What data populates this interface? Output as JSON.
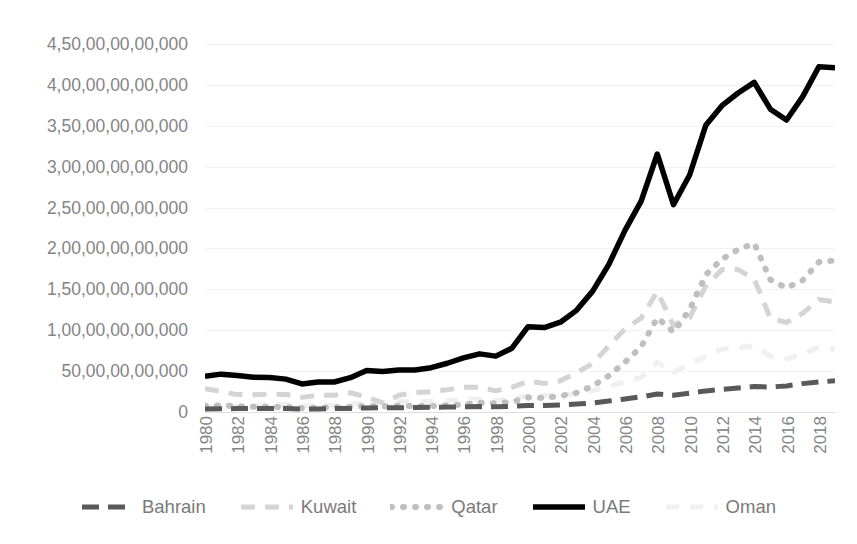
{
  "chart_data": {
    "type": "line",
    "title": "",
    "subtitle": "",
    "xlabel": "",
    "ylabel": "",
    "grid": true,
    "legend_position": "bottom",
    "xlim": [
      1980,
      2019
    ],
    "ylim": [
      0,
      450000000000
    ],
    "y_tick_labels": [
      "4,50,00,00,00,000",
      "4,00,00,00,00,000",
      "3,50,00,00,00,000",
      "3,00,00,00,00,000",
      "2,50,00,00,00,000",
      "2,00,00,00,00,000",
      "1,50,00,00,00,000",
      "1,00,00,00,00,000",
      "50,00,00,00,000",
      "0"
    ],
    "y_tick_values": [
      450000000000,
      400000000000,
      350000000000,
      300000000000,
      250000000000,
      200000000000,
      150000000000,
      100000000000,
      50000000000,
      0
    ],
    "x_tick_labels": [
      "1980",
      "1982",
      "1984",
      "1986",
      "1988",
      "1990",
      "1992",
      "1994",
      "1996",
      "1998",
      "2000",
      "2002",
      "2004",
      "2006",
      "2008",
      "2010",
      "2012",
      "2014",
      "2016",
      "2018"
    ],
    "x": [
      1980,
      1981,
      1982,
      1983,
      1984,
      1985,
      1986,
      1987,
      1988,
      1989,
      1990,
      1991,
      1992,
      1993,
      1994,
      1995,
      1996,
      1997,
      1998,
      1999,
      2000,
      2001,
      2002,
      2003,
      2004,
      2005,
      2006,
      2007,
      2008,
      2009,
      2010,
      2011,
      2012,
      2013,
      2014,
      2015,
      2016,
      2017,
      2018,
      2019
    ],
    "series": [
      {
        "name": "Bahrain",
        "color": "#595959",
        "style": "dashed",
        "width": 5.0,
        "dash": "17,9",
        "values": [
          3600000000,
          4000000000,
          4200000000,
          4300000000,
          4400000000,
          4200000000,
          3600000000,
          3800000000,
          4200000000,
          4400000000,
          5000000000,
          5100000000,
          5300000000,
          5400000000,
          5700000000,
          6000000000,
          6300000000,
          6600000000,
          6300000000,
          6900000000,
          8000000000,
          8000000000,
          8500000000,
          9700000000,
          11100000000,
          13500000000,
          15900000000,
          18500000000,
          22100000000,
          20600000000,
          22900000000,
          25800000000,
          27700000000,
          29400000000,
          31100000000,
          30600000000,
          31900000000,
          34700000000,
          36600000000,
          38200000000
        ]
      },
      {
        "name": "Kuwait",
        "color": "#d4d4d4",
        "style": "dashed",
        "width": 5.0,
        "dash": "14,10",
        "values": [
          28600000000,
          25100000000,
          21300000000,
          21200000000,
          21900000000,
          21500000000,
          17900000000,
          20300000000,
          20600000000,
          23500000000,
          18400000000,
          11200000000,
          20500000000,
          23600000000,
          24800000000,
          27200000000,
          30400000000,
          30400000000,
          25900000000,
          30100000000,
          37700000000,
          34900000000,
          38100000000,
          47900000000,
          59400000000,
          80800000000,
          101600000000,
          114700000000,
          147400000000,
          105900000000,
          115400000000,
          154000000000,
          174100000000,
          174200000000,
          162600000000,
          114700000000,
          109400000000,
          120700000000,
          137600000000,
          134600000000
        ]
      },
      {
        "name": "Qatar",
        "color": "#bfbfbf",
        "style": "dotted",
        "width": 6.0,
        "dash": "1,11",
        "values": [
          7700000000,
          8100000000,
          7000000000,
          6300000000,
          6400000000,
          6000000000,
          4700000000,
          5200000000,
          5700000000,
          6200000000,
          7400000000,
          6900000000,
          7700000000,
          7100000000,
          7300000000,
          8100000000,
          9100000000,
          11300000000,
          10700000000,
          12400000000,
          17800000000,
          17500000000,
          19500000000,
          23500000000,
          31700000000,
          44500000000,
          60900000000,
          79700000000,
          115300000000,
          97800000000,
          125100000000,
          167800000000,
          186800000000,
          198700000000,
          206200000000,
          161700000000,
          151700000000,
          161100000000,
          183300000000,
          185400000000
        ]
      },
      {
        "name": "UAE",
        "color": "#000000",
        "style": "solid",
        "width": 5.5,
        "dash": "",
        "values": [
          43600000000,
          46300000000,
          44700000000,
          42500000000,
          42100000000,
          40200000000,
          34300000000,
          36600000000,
          36700000000,
          42000000000,
          50700000000,
          49500000000,
          51300000000,
          51300000000,
          54200000000,
          59600000000,
          66100000000,
          71100000000,
          68300000000,
          78000000000,
          104300000000,
          103300000000,
          109800000000,
          124300000000,
          147800000000,
          180600000000,
          222100000000,
          257900000000,
          315500000000,
          253500000000,
          289800000000,
          350600000000,
          374600000000,
          390100000000,
          403100000000,
          370300000000,
          357000000000,
          385600000000,
          422200000000,
          421100000000
        ]
      },
      {
        "name": "Oman",
        "color": "#f0f0f0",
        "style": "dashed",
        "width": 5.0,
        "dash": "13,11",
        "values": [
          5980000000,
          6500000000,
          7100000000,
          7600000000,
          8300000000,
          9700000000,
          7400000000,
          8100000000,
          8000000000,
          9300000000,
          11700000000,
          11900000000,
          12900000000,
          12500000000,
          13100000000,
          13800000000,
          15300000000,
          15800000000,
          14100000000,
          16400000000,
          19500000000,
          19900000000,
          20700000000,
          22100000000,
          26200000000,
          31100000000,
          37200000000,
          42100000000,
          60900000000,
          48400000000,
          58600000000,
          68000000000,
          76900000000,
          78800000000,
          81000000000,
          68400000000,
          65100000000,
          70600000000,
          79300000000,
          76300000000
        ]
      }
    ]
  },
  "legend": {
    "items": [
      {
        "label": "Bahrain"
      },
      {
        "label": "Kuwait"
      },
      {
        "label": "Qatar"
      },
      {
        "label": "UAE"
      },
      {
        "label": "Oman"
      }
    ]
  }
}
